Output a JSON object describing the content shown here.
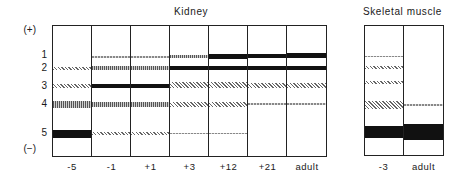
{
  "figure": {
    "panels": [
      {
        "title": "Kidney",
        "lanes": [
          {
            "label": "-5",
            "bands": [
              {
                "id": 2,
                "y": 67,
                "h": 3,
                "style": "dots"
              },
              {
                "id": 3,
                "y": 84,
                "h": 4,
                "style": "dots"
              },
              {
                "id": 4,
                "y": 101,
                "h": 7,
                "style": "hatch"
              },
              {
                "id": 5,
                "y": 130,
                "h": 8,
                "style": "black"
              }
            ]
          },
          {
            "label": "-1",
            "bands": [
              {
                "id": 1,
                "y": 56,
                "h": 2,
                "style": "faint"
              },
              {
                "id": 2,
                "y": 66,
                "h": 4,
                "style": "hatch"
              },
              {
                "id": 3,
                "y": 84,
                "h": 4,
                "style": "black"
              },
              {
                "id": 4,
                "y": 102,
                "h": 5,
                "style": "hatch"
              },
              {
                "id": 5,
                "y": 132,
                "h": 3,
                "style": "dots"
              }
            ]
          },
          {
            "label": "+1",
            "bands": [
              {
                "id": 1,
                "y": 56,
                "h": 2,
                "style": "faint"
              },
              {
                "id": 2,
                "y": 66,
                "h": 4,
                "style": "hatch"
              },
              {
                "id": 3,
                "y": 84,
                "h": 4,
                "style": "black"
              },
              {
                "id": 4,
                "y": 102,
                "h": 5,
                "style": "hatch"
              },
              {
                "id": 5,
                "y": 132,
                "h": 3,
                "style": "dots"
              }
            ]
          },
          {
            "label": "+3",
            "bands": [
              {
                "id": 1,
                "y": 55,
                "h": 3,
                "style": "hatch"
              },
              {
                "id": 2,
                "y": 66,
                "h": 4,
                "style": "black"
              },
              {
                "id": 3,
                "y": 82,
                "h": 6,
                "style": "dots"
              },
              {
                "id": 4,
                "y": 102,
                "h": 5,
                "style": "dots"
              },
              {
                "id": 5,
                "y": 133,
                "h": 1,
                "style": "faint"
              }
            ]
          },
          {
            "label": "+12",
            "bands": [
              {
                "id": 1,
                "y": 54,
                "h": 5,
                "style": "black"
              },
              {
                "id": 2,
                "y": 66,
                "h": 4,
                "style": "black"
              },
              {
                "id": 3,
                "y": 82,
                "h": 6,
                "style": "dots"
              },
              {
                "id": 4,
                "y": 102,
                "h": 5,
                "style": "dots"
              },
              {
                "id": 5,
                "y": 133,
                "h": 1,
                "style": "faint"
              }
            ]
          },
          {
            "label": "+21",
            "bands": [
              {
                "id": 1,
                "y": 54,
                "h": 4,
                "style": "black"
              },
              {
                "id": 2,
                "y": 66,
                "h": 4,
                "style": "black"
              },
              {
                "id": 3,
                "y": 83,
                "h": 5,
                "style": "dots"
              },
              {
                "id": 4,
                "y": 103,
                "h": 2,
                "style": "faint"
              }
            ]
          },
          {
            "label": "adult",
            "bands": [
              {
                "id": 1,
                "y": 53,
                "h": 5,
                "style": "black"
              },
              {
                "id": 2,
                "y": 66,
                "h": 4,
                "style": "black"
              },
              {
                "id": 3,
                "y": 83,
                "h": 5,
                "style": "dots"
              },
              {
                "id": 4,
                "y": 103,
                "h": 2,
                "style": "faint"
              }
            ]
          }
        ]
      },
      {
        "title": "Skeletal muscle",
        "lanes": [
          {
            "label": "-3",
            "bands": [
              {
                "y": 56,
                "h": 1,
                "style": "faint"
              },
              {
                "y": 66,
                "h": 3,
                "style": "dots"
              },
              {
                "y": 81,
                "h": 3,
                "style": "dots"
              },
              {
                "y": 101,
                "h": 8,
                "style": "dots"
              },
              {
                "y": 126,
                "h": 12,
                "style": "black"
              }
            ]
          },
          {
            "label": "adult",
            "bands": [
              {
                "y": 104,
                "h": 2,
                "style": "faint"
              },
              {
                "y": 124,
                "h": 16,
                "style": "black"
              }
            ]
          }
        ]
      }
    ],
    "y_axis": {
      "top_label": "(+)",
      "bottom_label": "(−)",
      "band_labels": [
        {
          "label": "1",
          "y": 56
        },
        {
          "label": "2",
          "y": 68
        },
        {
          "label": "3",
          "y": 86
        },
        {
          "label": "4",
          "y": 104
        },
        {
          "label": "5",
          "y": 133
        }
      ]
    }
  }
}
